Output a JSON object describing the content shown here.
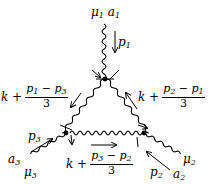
{
  "diagram": {
    "type": "feynman-diagram",
    "external_legs": [
      {
        "id": "leg1",
        "labels": "μ₁ a₁",
        "momentum": "p₁",
        "lorentz": "μ",
        "color": "a",
        "index": "1"
      },
      {
        "id": "leg2",
        "labels": "μ₂ a₂",
        "momentum": "p₂",
        "lorentz": "μ",
        "color": "a",
        "index": "2"
      },
      {
        "id": "leg3",
        "labels": "a₃ μ₃",
        "momentum": "p₃",
        "lorentz": "μ",
        "color": "a",
        "index": "3"
      }
    ],
    "internal_lines": [
      {
        "id": "left",
        "pre": "k +",
        "numerator": "p₁ − p₃",
        "denominator": "3"
      },
      {
        "id": "right",
        "pre": "k +",
        "numerator": "p₂ − p₁",
        "denominator": "3"
      },
      {
        "id": "bottom",
        "pre": "k +",
        "numerator": "p₃ − p₂",
        "denominator": "3"
      }
    ],
    "labels": {
      "mu1": "μ",
      "a1": "a",
      "sub1": "1",
      "mu2": "μ",
      "a2": "a",
      "sub2": "2",
      "mu3": "μ",
      "a3": "a",
      "sub3": "3",
      "p": "p",
      "k_plus": "k +",
      "three": "3",
      "minus": " − "
    }
  }
}
